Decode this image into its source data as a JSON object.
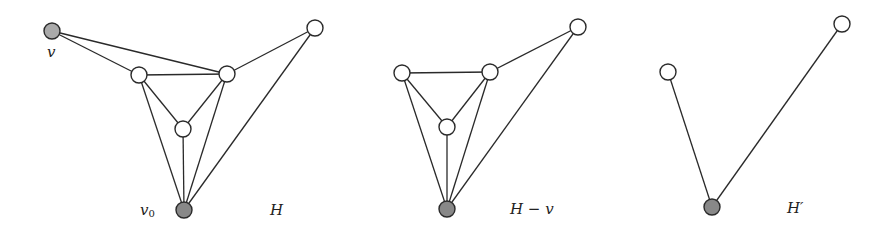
{
  "figure": {
    "graphs": [
      {
        "id": "H",
        "label": "H",
        "label_pos": [
          270,
          215
        ],
        "nodes": [
          {
            "id": "v",
            "x": 52,
            "y": 31,
            "fill": "#aaaaaa",
            "label": "v",
            "label_pos": [
              47,
              57
            ]
          },
          {
            "id": "a",
            "x": 139,
            "y": 75,
            "fill": "#ffffff"
          },
          {
            "id": "b",
            "x": 227,
            "y": 74,
            "fill": "#ffffff"
          },
          {
            "id": "t",
            "x": 315,
            "y": 28,
            "fill": "#ffffff"
          },
          {
            "id": "c",
            "x": 183,
            "y": 129,
            "fill": "#ffffff"
          },
          {
            "id": "v0",
            "x": 184,
            "y": 210,
            "fill": "#888888",
            "label": "v",
            "sub": "0",
            "label_pos": [
              140,
              215
            ]
          }
        ],
        "edges": [
          [
            "v",
            "a"
          ],
          [
            "v",
            "b"
          ],
          [
            "a",
            "b"
          ],
          [
            "b",
            "t"
          ],
          [
            "a",
            "c"
          ],
          [
            "b",
            "c"
          ],
          [
            "a",
            "v0"
          ],
          [
            "c",
            "v0"
          ],
          [
            "b",
            "v0"
          ],
          [
            "t",
            "v0"
          ]
        ]
      },
      {
        "id": "H-v",
        "label": "H − v",
        "label_pos": [
          510,
          214
        ],
        "nodes": [
          {
            "id": "a",
            "x": 402,
            "y": 73,
            "fill": "#ffffff"
          },
          {
            "id": "b",
            "x": 490,
            "y": 72,
            "fill": "#ffffff"
          },
          {
            "id": "t",
            "x": 578,
            "y": 27,
            "fill": "#ffffff"
          },
          {
            "id": "c",
            "x": 447,
            "y": 127,
            "fill": "#ffffff"
          },
          {
            "id": "v0",
            "x": 447,
            "y": 209,
            "fill": "#888888"
          }
        ],
        "edges": [
          [
            "a",
            "b"
          ],
          [
            "b",
            "t"
          ],
          [
            "a",
            "c"
          ],
          [
            "b",
            "c"
          ],
          [
            "a",
            "v0"
          ],
          [
            "c",
            "v0"
          ],
          [
            "b",
            "v0"
          ],
          [
            "t",
            "v0"
          ]
        ]
      },
      {
        "id": "H'",
        "label": "H′",
        "label_pos": [
          787,
          213
        ],
        "nodes": [
          {
            "id": "l",
            "x": 668,
            "y": 72,
            "fill": "#ffffff"
          },
          {
            "id": "t",
            "x": 842,
            "y": 24,
            "fill": "#ffffff"
          },
          {
            "id": "v0",
            "x": 712,
            "y": 207,
            "fill": "#888888"
          }
        ],
        "edges": [
          [
            "l",
            "v0"
          ],
          [
            "t",
            "v0"
          ]
        ]
      }
    ],
    "node_radius": 8
  }
}
